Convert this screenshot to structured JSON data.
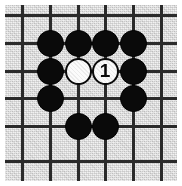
{
  "figure": {
    "name": "go-board-diagram",
    "width": 182,
    "height": 186,
    "board_color": "#c9c9c9",
    "line_color": "#2b2b2b",
    "margin_color": "#ffffff"
  },
  "board": {
    "vertical_lines_x": [
      22,
      50,
      78,
      105,
      133,
      161
    ],
    "horizontal_lines_y": [
      15,
      43,
      71,
      98,
      126,
      161
    ],
    "line_width": 3,
    "stone_diameter": 27
  },
  "stones": [
    {
      "id": "b1",
      "color": "black",
      "x": 50,
      "y": 43,
      "label": ""
    },
    {
      "id": "b2",
      "color": "black",
      "x": 78,
      "y": 43,
      "label": ""
    },
    {
      "id": "b3",
      "color": "black",
      "x": 105,
      "y": 43,
      "label": ""
    },
    {
      "id": "b4",
      "color": "black",
      "x": 133,
      "y": 43,
      "label": ""
    },
    {
      "id": "b5",
      "color": "black",
      "x": 50,
      "y": 71,
      "label": ""
    },
    {
      "id": "w1",
      "color": "white",
      "x": 78,
      "y": 71,
      "label": ""
    },
    {
      "id": "w2",
      "color": "white",
      "x": 105,
      "y": 71,
      "label": "1"
    },
    {
      "id": "b6",
      "color": "black",
      "x": 133,
      "y": 71,
      "label": ""
    },
    {
      "id": "b7",
      "color": "black",
      "x": 50,
      "y": 98,
      "label": ""
    },
    {
      "id": "b8",
      "color": "black",
      "x": 133,
      "y": 98,
      "label": ""
    },
    {
      "id": "b9",
      "color": "black",
      "x": 78,
      "y": 126,
      "label": ""
    },
    {
      "id": "b10",
      "color": "black",
      "x": 105,
      "y": 126,
      "label": ""
    }
  ]
}
